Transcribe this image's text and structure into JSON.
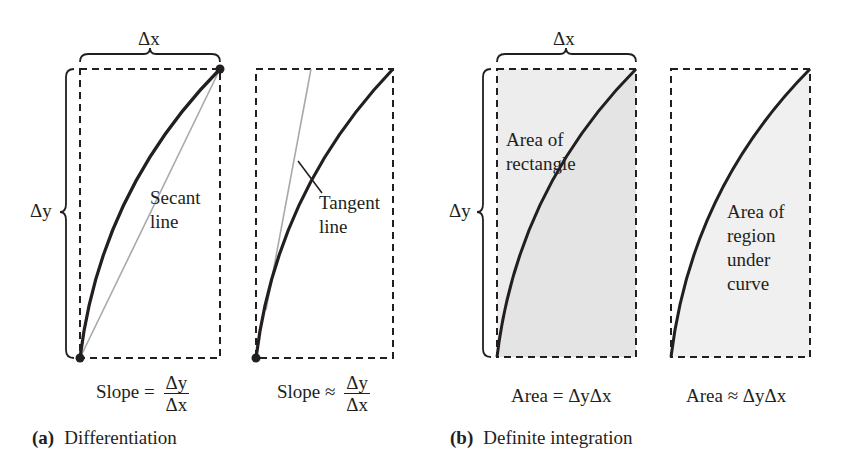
{
  "panels": {
    "a": {
      "caption_tag": "(a)",
      "caption_text": "Differentiation",
      "left": {
        "delta_x": "Δx",
        "delta_y": "Δy",
        "curve_label": "Secant\nline",
        "formula_lhs": "Slope =",
        "formula_num": "Δy",
        "formula_den": "Δx"
      },
      "right": {
        "curve_label": "Tangent\nline",
        "formula_lhs": "Slope ≈",
        "formula_num": "Δy",
        "formula_den": "Δx"
      }
    },
    "b": {
      "caption_tag": "(b)",
      "caption_text": "Definite integration",
      "left": {
        "delta_x": "Δx",
        "delta_y": "Δy",
        "area_label": "Area of\nrectangle",
        "formula": "Area = ΔyΔx"
      },
      "right": {
        "area_label": "Area of\nregion\nunder\ncurve",
        "formula": "Area ≈ ΔyΔx"
      }
    }
  },
  "colors": {
    "ink": "#231f20",
    "secant_tangent_line": "#a7a9ac",
    "shade_rect": "#ececec",
    "shade_region": "#f0f0f0",
    "dashed_box": "#231f20"
  }
}
